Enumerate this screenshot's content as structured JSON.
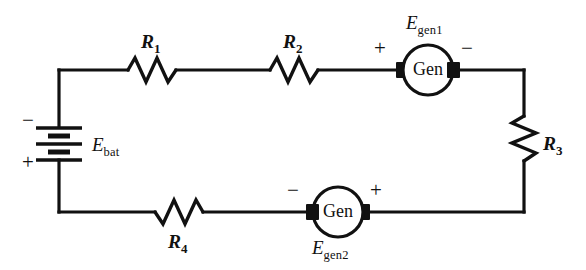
{
  "diagram": {
    "type": "electrical-circuit-schematic",
    "background_color": "#ffffff",
    "line_color": "#111111",
    "width": 586,
    "height": 270
  },
  "sources": {
    "battery": {
      "label_main": "E",
      "label_sub": "bat",
      "terminal_top": "−",
      "terminal_bottom": "+",
      "symbol": "battery-cell-stack"
    },
    "generator1": {
      "body_text": "Gen",
      "label_main": "E",
      "label_sub": "gen1",
      "terminal_left": "+",
      "terminal_right": "−",
      "label_position": "above"
    },
    "generator2": {
      "body_text": "Gen",
      "label_main": "E",
      "label_sub": "gen2",
      "terminal_left": "−",
      "terminal_right": "+",
      "label_position": "below"
    }
  },
  "resistors": [
    {
      "label_main": "R",
      "label_sub": "1",
      "orientation": "horizontal",
      "branch": "top",
      "label_position": "above"
    },
    {
      "label_main": "R",
      "label_sub": "2",
      "orientation": "horizontal",
      "branch": "top",
      "label_position": "above"
    },
    {
      "label_main": "R",
      "label_sub": "3",
      "orientation": "vertical",
      "branch": "right",
      "label_position": "right"
    },
    {
      "label_main": "R",
      "label_sub": "4",
      "orientation": "horizontal",
      "branch": "bottom",
      "label_position": "below"
    }
  ]
}
